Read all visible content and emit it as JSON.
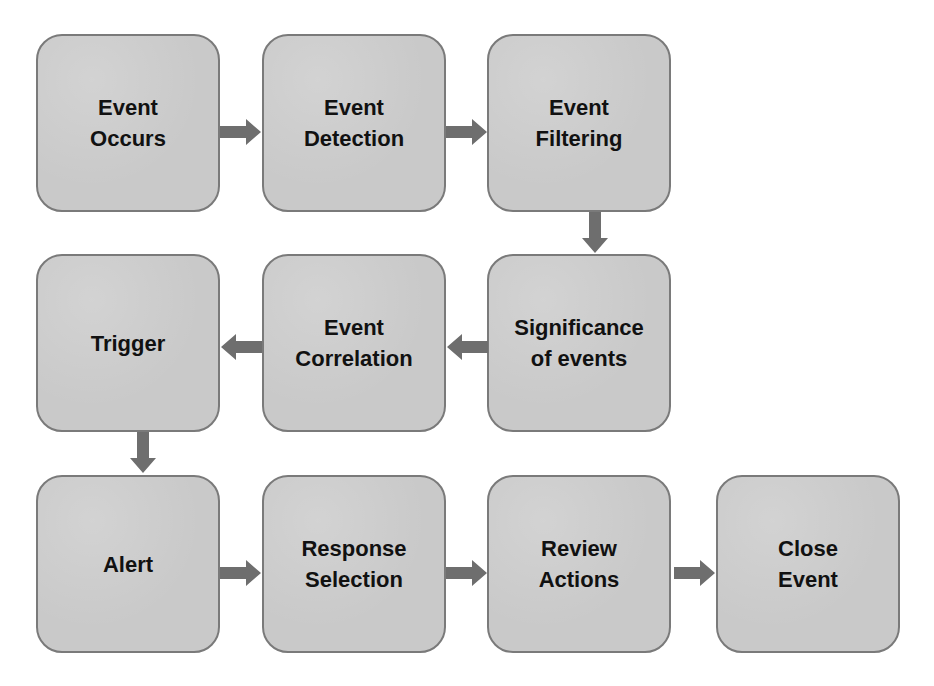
{
  "diagram": {
    "type": "flowchart",
    "colors": {
      "box_fill": "#c9c9c9",
      "box_border": "#7a7a7a",
      "arrow": "#6e6e6e",
      "text": "#111111"
    },
    "nodes": [
      {
        "id": "event-occurs",
        "label": "Event\nOccurs"
      },
      {
        "id": "event-detection",
        "label": "Event\nDetection"
      },
      {
        "id": "event-filtering",
        "label": "Event\nFiltering"
      },
      {
        "id": "significance-of-events",
        "label": "Significance\nof events"
      },
      {
        "id": "event-correlation",
        "label": "Event\nCorrelation"
      },
      {
        "id": "trigger",
        "label": "Trigger"
      },
      {
        "id": "alert",
        "label": "Alert"
      },
      {
        "id": "response-selection",
        "label": "Response\nSelection"
      },
      {
        "id": "review-actions",
        "label": "Review\nActions"
      },
      {
        "id": "close-event",
        "label": "Close\nEvent"
      }
    ],
    "edges": [
      {
        "from": "event-occurs",
        "to": "event-detection",
        "direction": "right"
      },
      {
        "from": "event-detection",
        "to": "event-filtering",
        "direction": "right"
      },
      {
        "from": "event-filtering",
        "to": "significance-of-events",
        "direction": "down"
      },
      {
        "from": "significance-of-events",
        "to": "event-correlation",
        "direction": "left"
      },
      {
        "from": "event-correlation",
        "to": "trigger",
        "direction": "left"
      },
      {
        "from": "trigger",
        "to": "alert",
        "direction": "down"
      },
      {
        "from": "alert",
        "to": "response-selection",
        "direction": "right"
      },
      {
        "from": "response-selection",
        "to": "review-actions",
        "direction": "right"
      },
      {
        "from": "review-actions",
        "to": "close-event",
        "direction": "right"
      }
    ]
  }
}
